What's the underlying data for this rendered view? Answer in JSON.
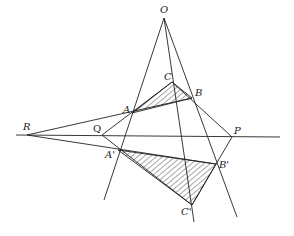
{
  "figure": {
    "points": {
      "O": {
        "label": "O",
        "x": 164,
        "y": 18
      },
      "A": {
        "label": "A",
        "x": 132,
        "y": 113
      },
      "B": {
        "label": "B",
        "x": 192,
        "y": 98
      },
      "C": {
        "label": "C",
        "x": 172,
        "y": 82
      },
      "A1": {
        "label": "A'",
        "x": 118,
        "y": 150
      },
      "B1": {
        "label": "B'",
        "x": 216,
        "y": 164
      },
      "C1": {
        "label": "C'",
        "x": 192,
        "y": 205
      },
      "P": {
        "label": "P",
        "x": 232,
        "y": 137
      },
      "Q": {
        "label": "Q",
        "x": 102,
        "y": 135
      },
      "R": {
        "label": "R",
        "x": 27,
        "y": 135
      }
    },
    "labels": {
      "O": "O",
      "A": "A",
      "B": "B",
      "C": "C",
      "A1": "A'",
      "B1": "B'",
      "C1": "C'",
      "P": "P",
      "Q": "Q",
      "R": "R"
    },
    "shaded_triangles": [
      "ABC",
      "A'B'C'"
    ],
    "axis_line": "RQP"
  }
}
